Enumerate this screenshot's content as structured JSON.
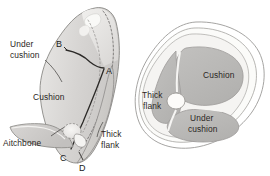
{
  "figure": {
    "background_color": "#ffffff",
    "views": [
      {
        "id": "side-view",
        "name": "Side view of rump with cutting lines",
        "labels": [
          {
            "id": "under-cushion",
            "text_line1": "Under",
            "text_line2": "cushion"
          },
          {
            "id": "cushion",
            "text": "Cushion"
          },
          {
            "id": "aitchbone",
            "text": "Aitchbone"
          },
          {
            "id": "thick-flank",
            "text_line1": "Thick",
            "text_line2": "flank"
          }
        ],
        "cut_points": [
          {
            "id": "point-a",
            "text": "A"
          },
          {
            "id": "point-b",
            "text": "B"
          },
          {
            "id": "point-c",
            "text": "C"
          },
          {
            "id": "point-d",
            "text": "D"
          }
        ]
      },
      {
        "id": "cross-section-view",
        "name": "Cross-section through rump showing muscle seams",
        "labels": [
          {
            "id": "cushion",
            "text": "Cushion"
          },
          {
            "id": "under-cushion",
            "text_line1": "Under",
            "text_line2": "cushion"
          },
          {
            "id": "thick-flank",
            "text_line1": "Thick",
            "text_line2": "flank"
          }
        ]
      }
    ]
  },
  "colors": {
    "meat_fill": "#cfcdcb",
    "meat_fill_light": "#e4e3e1",
    "meat_fill_lighter": "#efeeec",
    "muscle_fill": "#b9b8b6",
    "outline": "#8b8a88",
    "outline_dark": "#3a3836",
    "bone_fill": "#f2f1ef",
    "text": "#2b2724"
  }
}
